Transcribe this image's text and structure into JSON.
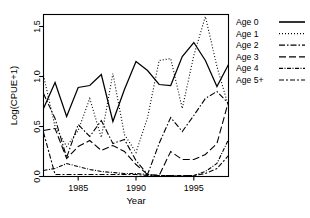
{
  "chart_data": {
    "type": "line",
    "title": "",
    "xlabel": "Year",
    "ylabel": "Log(CPUE+1)",
    "xlim": [
      1982,
      1998
    ],
    "ylim": [
      0.0,
      1.62
    ],
    "grid": false,
    "legend_position": "right",
    "xticks": [
      1985,
      1990,
      1995
    ],
    "xticklabels": [
      "1985",
      "1990",
      "1995"
    ],
    "yticks": [
      0.0,
      0.5,
      1.0,
      1.5
    ],
    "yticklabels": [
      "0.0",
      "0.5",
      "1.0",
      "1.5"
    ],
    "x": [
      1982,
      1983,
      1984,
      1985,
      1986,
      1987,
      1988,
      1989,
      1990,
      1991,
      1992,
      1993,
      1994,
      1995,
      1996,
      1997,
      1998
    ],
    "series": [
      {
        "name": "Age 0",
        "dash": "none",
        "values": [
          0.68,
          0.94,
          0.6,
          0.89,
          0.91,
          1.02,
          0.55,
          0.87,
          1.15,
          1.06,
          0.92,
          0.91,
          1.2,
          1.34,
          1.16,
          0.9,
          1.12
        ]
      },
      {
        "name": "Age 1",
        "dash": "dotted",
        "values": [
          1.01,
          0.5,
          0.3,
          0.46,
          0.78,
          0.39,
          1.03,
          0.42,
          0.24,
          0.59,
          1.16,
          1.18,
          0.68,
          1.21,
          1.6,
          1.1,
          0.7
        ]
      },
      {
        "name": "Age 2",
        "dash": "dashdot",
        "values": [
          0.83,
          0.58,
          0.19,
          0.52,
          0.4,
          0.56,
          0.33,
          0.37,
          0.16,
          0.02,
          0.33,
          0.59,
          0.45,
          0.61,
          0.78,
          0.85,
          0.73
        ]
      },
      {
        "name": "Age 3",
        "dash": "longdash",
        "values": [
          0.46,
          0.48,
          0.18,
          0.3,
          0.36,
          0.26,
          0.31,
          0.25,
          0.12,
          0.02,
          0.01,
          0.25,
          0.17,
          0.17,
          0.22,
          0.33,
          0.75
        ]
      },
      {
        "name": "Age 4",
        "dash": "finedashdot",
        "values": [
          0.06,
          0.08,
          0.13,
          0.1,
          0.07,
          0.05,
          0.04,
          0.03,
          0.03,
          0.02,
          0.01,
          0.01,
          0.01,
          0.01,
          0.05,
          0.13,
          0.37
        ]
      },
      {
        "name": "Age 5+",
        "dash": "dashdotlong",
        "values": [
          0.44,
          0.02,
          0.02,
          0.02,
          0.02,
          0.02,
          0.02,
          0.02,
          0.02,
          0.01,
          0.01,
          0.01,
          0.01,
          0.01,
          0.03,
          0.08,
          0.21
        ]
      }
    ]
  },
  "legend": {
    "items": [
      {
        "label": "Age 0"
      },
      {
        "label": "Age 1"
      },
      {
        "label": "Age 2"
      },
      {
        "label": "Age 3"
      },
      {
        "label": "Age 4"
      },
      {
        "label": "Age 5+"
      }
    ]
  }
}
